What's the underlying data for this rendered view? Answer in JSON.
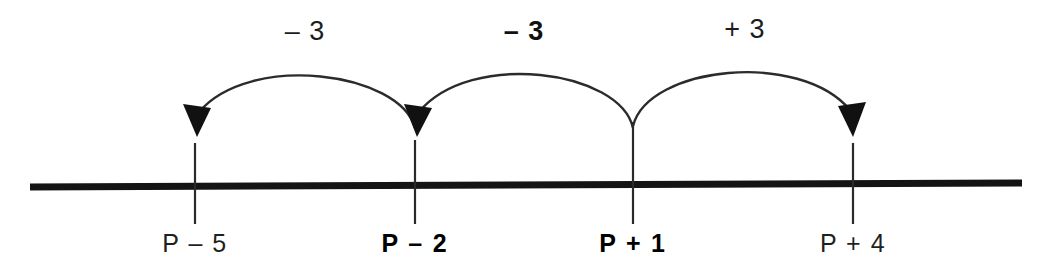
{
  "diagram": {
    "type": "number-line-jumps",
    "number_line": {
      "stroke_color": "#141414",
      "thickness": 7,
      "x_start": 30,
      "x_end": 1022,
      "y_start": 187,
      "y_end": 183
    },
    "ticks": [
      {
        "id": "tick-1",
        "label": "P – 5",
        "x": 195,
        "bold": false
      },
      {
        "id": "tick-2",
        "label": "P – 2",
        "x": 415,
        "bold": true
      },
      {
        "id": "tick-3",
        "label": "P + 1",
        "x": 633,
        "bold": true
      },
      {
        "id": "tick-4",
        "label": "P + 4",
        "x": 853,
        "bold": false
      }
    ],
    "jumps": [
      {
        "id": "jump-1",
        "label": "– 3",
        "value": -3,
        "from_x": 415,
        "to_x": 195,
        "direction": "left",
        "label_x": 305,
        "label_y": 16,
        "heavy": false
      },
      {
        "id": "jump-2",
        "label": "– 3",
        "value": -3,
        "from_x": 633,
        "to_x": 415,
        "direction": "left",
        "label_x": 524,
        "label_y": 16,
        "heavy": true
      },
      {
        "id": "jump-3",
        "label": "+ 3",
        "value": 3,
        "from_x": 633,
        "to_x": 853,
        "direction": "right",
        "label_x": 745,
        "label_y": 14,
        "heavy": false
      }
    ],
    "colors": {
      "line": "#141414",
      "tick": "#2a2a2a",
      "arc": "#2b2b2b",
      "text": "#1c1c1c",
      "background": "#ffffff"
    }
  }
}
